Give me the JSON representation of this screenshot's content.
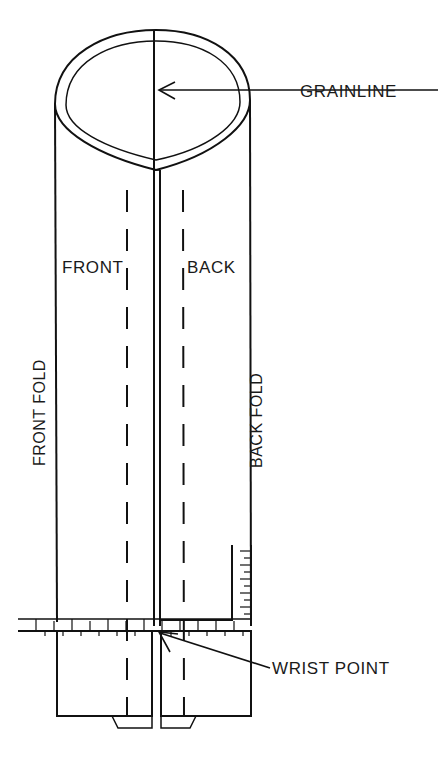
{
  "diagram": {
    "background_color": "#ffffff",
    "line_color": "#111111",
    "labels": {
      "grainline": "GRAINLINE",
      "front": "FRONT",
      "back": "BACK",
      "front_fold": "FRONT FOLD",
      "back_fold": "BACK FOLD",
      "wrist_point": "WRIST POINT"
    },
    "annotations": [
      {
        "id": "grainline",
        "text": "GRAINLINE",
        "leader": "horizontal line with left-pointing arrow",
        "points_to": "center seam at top of sleeve tube"
      },
      {
        "id": "wrist-point",
        "text": "WRIST POINT",
        "leader": "diagonal line with up-left arrow",
        "points_to": "center seam at ruler line"
      }
    ],
    "features": [
      {
        "id": "sleeve-tube",
        "kind": "cylinder-body"
      },
      {
        "id": "sleeve-opening",
        "kind": "elliptical-opening"
      },
      {
        "id": "center-seam",
        "kind": "double-line-seam"
      },
      {
        "id": "front-fold-line",
        "kind": "fold-edge"
      },
      {
        "id": "back-fold-line",
        "kind": "fold-edge"
      },
      {
        "id": "front-dashed-guide",
        "kind": "dashed-guide"
      },
      {
        "id": "back-dashed-guide",
        "kind": "dashed-guide"
      },
      {
        "id": "horizontal-ruler",
        "kind": "measuring-ruler"
      },
      {
        "id": "vertical-ruler",
        "kind": "measuring-ruler"
      },
      {
        "id": "cuff-front-panel",
        "kind": "cuff-panel"
      },
      {
        "id": "cuff-back-panel",
        "kind": "cuff-panel"
      }
    ]
  }
}
